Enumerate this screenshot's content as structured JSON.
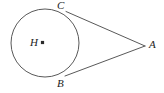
{
  "figure": {
    "background_color": "#ffffff",
    "stroke_color": "#595959",
    "label_color": "#1c1c1c",
    "labels": {
      "center": "H",
      "tangent_point_top": "C",
      "tangent_point_bottom": "B",
      "external_point": "A"
    },
    "geometry": {
      "circle": {
        "cx": 45,
        "cy": 43,
        "r": 34
      },
      "center_dot": {
        "cx": 42.5,
        "cy": 42.5,
        "size": 3.2
      },
      "external_point": {
        "x": 145,
        "y": 46
      },
      "tangent_point_top": {
        "x": 66,
        "y": 11.5
      },
      "tangent_point_bottom": {
        "x": 65,
        "y": 76
      },
      "tangent_top_path": "M 66 11.5 L 145 46",
      "tangent_bottom_path": "M 65 76 L 145 46",
      "stroke_width": 1
    }
  }
}
